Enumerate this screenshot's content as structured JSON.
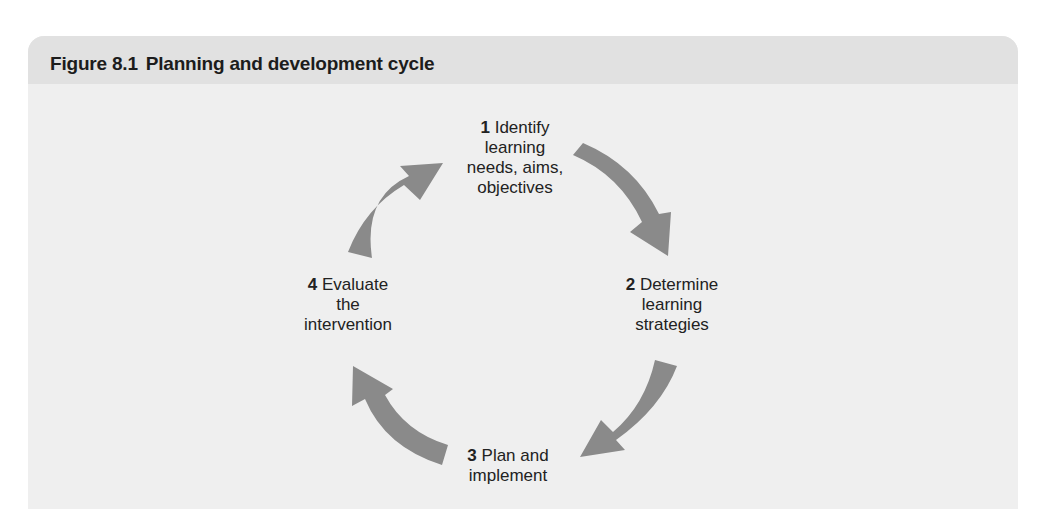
{
  "figure": {
    "number": "Figure 8.1",
    "title": "Planning and development cycle"
  },
  "colors": {
    "panel_bg": "#efefef",
    "header_bg": "#e1e1e1",
    "arrow": "#8a8a8a",
    "text": "#222222"
  },
  "cycle": {
    "steps": [
      {
        "num": "1",
        "lines": [
          "Identify",
          "learning",
          "needs, aims,",
          "objectives"
        ]
      },
      {
        "num": "2",
        "lines": [
          "Determine",
          "learning",
          "strategies"
        ]
      },
      {
        "num": "3",
        "lines": [
          "Plan and",
          "implement"
        ]
      },
      {
        "num": "4",
        "lines": [
          "Evaluate",
          "the",
          "intervention"
        ]
      }
    ],
    "arrows": [
      {
        "from": "1",
        "to": "2"
      },
      {
        "from": "2",
        "to": "3"
      },
      {
        "from": "3",
        "to": "4"
      },
      {
        "from": "4",
        "to": "1"
      }
    ]
  }
}
